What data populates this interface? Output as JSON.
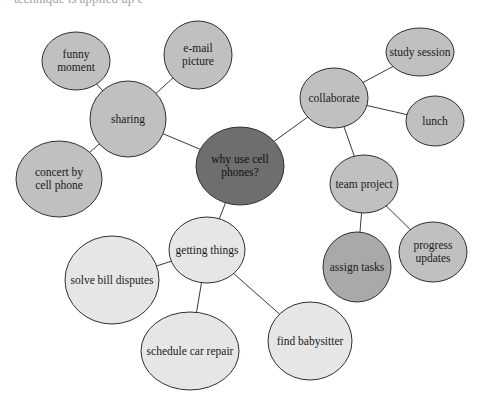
{
  "top_fragment": "technique is applied         up          e",
  "colors": {
    "center_fill": "#6e6e6e",
    "branch_fill": "#c0c0c0",
    "accent_fill": "#a9a9a9",
    "light_fill": "#e6e6e6",
    "stroke": "#2f2f2f"
  },
  "diagram": {
    "title": "why use cell phones?",
    "nodes": [
      {
        "id": "center",
        "label": "why use cell\nphones?",
        "cx": 240,
        "cy": 166,
        "rx": 44,
        "ry": 39,
        "fill": "center"
      },
      {
        "id": "sharing",
        "label": "sharing",
        "cx": 128,
        "cy": 119,
        "rx": 38,
        "ry": 38,
        "fill": "branch"
      },
      {
        "id": "funny-moment",
        "label": "funny\nmoment",
        "cx": 76,
        "cy": 61,
        "rx": 34,
        "ry": 29,
        "fill": "branch"
      },
      {
        "id": "email-picture",
        "label": "e-mail\npicture",
        "cx": 198,
        "cy": 55,
        "rx": 34,
        "ry": 34,
        "fill": "branch"
      },
      {
        "id": "concert",
        "label": "concert by\ncell phone",
        "cx": 59,
        "cy": 179,
        "rx": 43,
        "ry": 38,
        "fill": "branch"
      },
      {
        "id": "collaborate",
        "label": "collaborate",
        "cx": 334,
        "cy": 98,
        "rx": 34,
        "ry": 30,
        "fill": "branch"
      },
      {
        "id": "study-session",
        "label": "study session",
        "cx": 420,
        "cy": 52,
        "rx": 34,
        "ry": 24,
        "fill": "branch"
      },
      {
        "id": "lunch",
        "label": "lunch",
        "cx": 435,
        "cy": 121,
        "rx": 29,
        "ry": 25,
        "fill": "branch"
      },
      {
        "id": "team-project",
        "label": "team project",
        "cx": 364,
        "cy": 184,
        "rx": 34,
        "ry": 29,
        "fill": "branch"
      },
      {
        "id": "assign-tasks",
        "label": "assign tasks",
        "cx": 357,
        "cy": 267,
        "rx": 34,
        "ry": 35,
        "fill": "accent"
      },
      {
        "id": "progress-updates",
        "label": "progress\nupdates",
        "cx": 433,
        "cy": 252,
        "rx": 34,
        "ry": 30,
        "fill": "branch"
      },
      {
        "id": "getting-things",
        "label": "getting things",
        "cx": 207,
        "cy": 250,
        "rx": 38,
        "ry": 33,
        "fill": "light"
      },
      {
        "id": "solve-bill-disputes",
        "label": "solve bill disputes",
        "cx": 112,
        "cy": 280,
        "rx": 47,
        "ry": 44,
        "fill": "light"
      },
      {
        "id": "schedule-car-repair",
        "label": "schedule car repair",
        "cx": 190,
        "cy": 351,
        "rx": 49,
        "ry": 39,
        "fill": "light"
      },
      {
        "id": "find-babysitter",
        "label": "find babysitter",
        "cx": 310,
        "cy": 341,
        "rx": 42,
        "ry": 39,
        "fill": "light"
      }
    ],
    "edges": [
      [
        "center",
        "sharing"
      ],
      [
        "center",
        "collaborate"
      ],
      [
        "center",
        "getting-things"
      ],
      [
        "sharing",
        "funny-moment"
      ],
      [
        "sharing",
        "email-picture"
      ],
      [
        "sharing",
        "concert"
      ],
      [
        "collaborate",
        "study-session"
      ],
      [
        "collaborate",
        "lunch"
      ],
      [
        "collaborate",
        "team-project"
      ],
      [
        "team-project",
        "assign-tasks"
      ],
      [
        "team-project",
        "progress-updates"
      ],
      [
        "getting-things",
        "solve-bill-disputes"
      ],
      [
        "getting-things",
        "schedule-car-repair"
      ],
      [
        "getting-things",
        "find-babysitter"
      ]
    ]
  }
}
